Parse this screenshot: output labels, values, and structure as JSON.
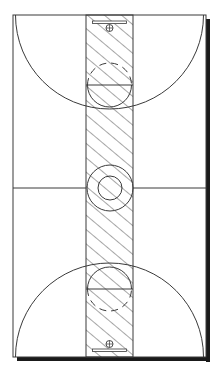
{
  "diagram": {
    "type": "basketball-court-top-view",
    "colors": {
      "background": "#ffffff",
      "line": "#3a3a3a",
      "shadow": "#1a1a1a",
      "hatch": "#3a3a3a"
    },
    "court": {
      "x": 13,
      "y": 15,
      "width": 193,
      "height": 342
    },
    "lane": {
      "x": 86,
      "width": 47
    },
    "center_line_y": 188,
    "center_circle": {
      "cx": 110,
      "cy": 188,
      "r_outer": 23,
      "r_inner": 12
    },
    "ends": [
      {
        "name": "top",
        "baseline_y": 15,
        "three_point_radius": 94,
        "free_throw_y": 85,
        "ft_circle_r": 22,
        "backboard_y": 22,
        "hoop_y": 28
      },
      {
        "name": "bottom",
        "baseline_y": 357,
        "three_point_radius": 94,
        "free_throw_y": 289,
        "ft_circle_r": 22,
        "backboard_y": 350,
        "hoop_y": 344
      }
    ]
  }
}
